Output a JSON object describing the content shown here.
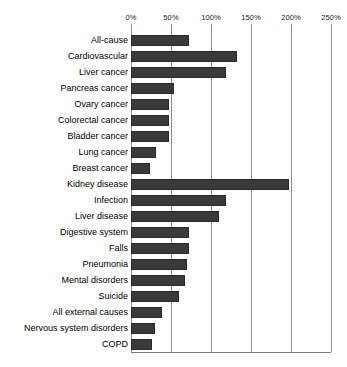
{
  "chart_data": {
    "type": "bar",
    "orientation": "horizontal",
    "title": "",
    "subtitle": "",
    "xlabel": "",
    "ylabel": "",
    "xlim": [
      0,
      250
    ],
    "ylim": null,
    "grid": true,
    "legend": null,
    "legend_position": "none",
    "x_unit": "%",
    "xticks": [
      0,
      50,
      100,
      150,
      200,
      250
    ],
    "xtick_labels": [
      "0%",
      "50%",
      "100%",
      "150%",
      "200%",
      "250%"
    ],
    "categories": [
      "All-cause",
      "Cardiovascular",
      "Liver cancer",
      "Pancreas cancer",
      "Ovary cancer",
      "Colorectal cancer",
      "Bladder cancer",
      "Lung cancer",
      "Breast cancer",
      "Kidney disease",
      "Infection",
      "Liver disease",
      "Digestive system",
      "Falls",
      "Pneumonia",
      "Mental disorders",
      "Suicide",
      "All external causes",
      "Nervous system disorders",
      "COPD"
    ],
    "values": [
      72,
      133,
      119,
      54,
      47,
      47,
      47,
      31,
      24,
      197,
      119,
      110,
      73,
      73,
      70,
      67,
      60,
      39,
      30,
      26
    ],
    "bar_color": "#3a3a3a",
    "gridline_color": "#8d8d8d",
    "background_color": "#ffffff"
  }
}
